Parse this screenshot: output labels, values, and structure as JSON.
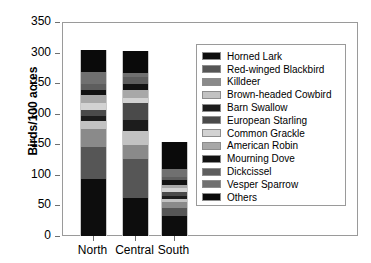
{
  "chart_data": {
    "type": "bar",
    "subtype": "stacked-bar",
    "title": "",
    "xlabel": "",
    "ylabel": "Birds/100 acres",
    "ylim": [
      0,
      350
    ],
    "yticks": [
      0,
      50,
      100,
      150,
      200,
      250,
      300,
      350
    ],
    "ytick_labels": [
      "0",
      "50",
      "100",
      "150",
      "200",
      "250",
      "300",
      "350"
    ],
    "grid": false,
    "legend_position": "inside-upper-right",
    "categories": [
      "North",
      "Central",
      "South"
    ],
    "totals": [
      305,
      302,
      154
    ],
    "series": [
      {
        "name": "Horned Lark",
        "color": "#0d0d0d",
        "values": [
          93,
          62,
          33
        ]
      },
      {
        "name": "Red-winged Blackbird",
        "color": "#565656",
        "values": [
          52,
          64,
          12
        ]
      },
      {
        "name": "Killdeer",
        "color": "#8a8a8a",
        "values": [
          30,
          23,
          11
        ]
      },
      {
        "name": "Brown-headed Cowbird",
        "color": "#c2c2c2",
        "values": [
          13,
          23,
          5
        ]
      },
      {
        "name": "Barn Swallow",
        "color": "#1c1c1c",
        "values": [
          8,
          17,
          5
        ]
      },
      {
        "name": "European Starling",
        "color": "#4a4a4a",
        "values": [
          10,
          28,
          6
        ]
      },
      {
        "name": "Common Grackle",
        "color": "#d2d2d2",
        "values": [
          12,
          9,
          6
        ]
      },
      {
        "name": "American Robin",
        "color": "#a8a8a8",
        "values": [
          12,
          13,
          6
        ]
      },
      {
        "name": "Mourning Dove",
        "color": "#121212",
        "values": [
          8,
          10,
          7
        ]
      },
      {
        "name": "Dickcissel",
        "color": "#5e5e5e",
        "values": [
          10,
          11,
          6
        ]
      },
      {
        "name": "Vesper Sparrow",
        "color": "#707070",
        "values": [
          21,
          6,
          13
        ]
      },
      {
        "name": "Others",
        "color": "#0a0a0a",
        "values": [
          36,
          36,
          44
        ]
      }
    ]
  },
  "axis": {
    "ylabel": "Birds/100 acres",
    "ytick_labels": [
      "350",
      "300",
      "250",
      "200",
      "150",
      "100",
      "50",
      "0"
    ],
    "xtick_labels": [
      "North",
      "Central",
      "South"
    ]
  },
  "legend": {
    "items": [
      {
        "label": "Horned Lark",
        "swatch": "#0d0d0d"
      },
      {
        "label": "Red-winged Blackbird",
        "swatch": "#565656"
      },
      {
        "label": "Killdeer",
        "swatch": "#8a8a8a"
      },
      {
        "label": "Brown-headed Cowbird",
        "swatch": "#c2c2c2"
      },
      {
        "label": "Barn Swallow",
        "swatch": "#1c1c1c"
      },
      {
        "label": "European Starling",
        "swatch": "#4a4a4a"
      },
      {
        "label": "Common Grackle",
        "swatch": "#d2d2d2"
      },
      {
        "label": "American Robin",
        "swatch": "#a8a8a8"
      },
      {
        "label": "Mourning Dove",
        "swatch": "#121212"
      },
      {
        "label": "Dickcissel",
        "swatch": "#5e5e5e"
      },
      {
        "label": "Vesper Sparrow",
        "swatch": "#707070"
      },
      {
        "label": "Others",
        "swatch": "#0a0a0a"
      }
    ]
  }
}
